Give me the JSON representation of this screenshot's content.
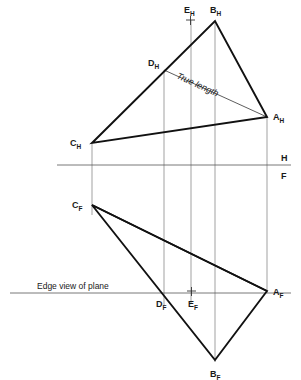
{
  "figure": {
    "width": 301,
    "height": 380,
    "background": "#ffffff",
    "line_color_heavy": "#111111",
    "line_color_light": "#777777",
    "text_color": "#1a1a1a"
  },
  "reference_line": {
    "name": "H-F folding line",
    "upper_label": "H",
    "lower_label": "F",
    "y": 165,
    "x_start": 57,
    "x_end": 291,
    "upper_label_x": 283,
    "upper_label_y": 160,
    "lower_label_x": 283,
    "lower_label_y": 177
  },
  "annotations": {
    "true_length": "True length",
    "edge_view": "Edge view of plane"
  },
  "horizontal_view": {
    "name": "top-view",
    "points": [
      {
        "id": "A_H",
        "letter": "A",
        "sub": "H",
        "x": 267,
        "y": 117,
        "label_x": 273,
        "label_y": 116
      },
      {
        "id": "B_H",
        "letter": "B",
        "sub": "H",
        "x": 215,
        "y": 21,
        "label_x": 212,
        "label_y": 11
      },
      {
        "id": "C_H",
        "letter": "C",
        "sub": "H",
        "x": 92,
        "y": 143,
        "label_x": 72,
        "label_y": 142
      },
      {
        "id": "D_H",
        "letter": "D",
        "sub": "H",
        "x": 164,
        "y": 70,
        "label_x": 150,
        "label_y": 63
      },
      {
        "id": "E_H",
        "letter": "E",
        "sub": "H",
        "x": 190,
        "y": 20,
        "label_x": 186,
        "label_y": 11
      }
    ],
    "triangle": "A_H B_H C_H",
    "true_length_line": "D_H to A_H",
    "cross_marks": [
      "E_H"
    ]
  },
  "frontal_view": {
    "name": "front-view",
    "points": [
      {
        "id": "A_F",
        "letter": "A",
        "sub": "F",
        "x": 267,
        "y": 291,
        "label_x": 273,
        "label_y": 291
      },
      {
        "id": "B_F",
        "letter": "B",
        "sub": "F",
        "x": 215,
        "y": 360,
        "label_x": 211,
        "label_y": 375
      },
      {
        "id": "C_F",
        "letter": "C",
        "sub": "F",
        "x": 92,
        "y": 205,
        "label_x": 74,
        "label_y": 203
      },
      {
        "id": "D_F",
        "letter": "D",
        "sub": "F",
        "x": 164,
        "y": 293,
        "label_x": 157,
        "label_y": 306
      },
      {
        "id": "E_F",
        "letter": "E",
        "sub": "F",
        "x": 191,
        "y": 291,
        "label_x": 190,
        "label_y": 307
      }
    ],
    "triangle": "A_F B_F C_F",
    "edge_view_line": {
      "x_start": 10,
      "x_end": 291,
      "y": 293
    },
    "cross_marks": [
      "E_F"
    ]
  },
  "projectors": {
    "name": "vertical projection lines",
    "lines": [
      {
        "from": "C",
        "x": 92,
        "y_top": 143,
        "y_bottom": 215
      },
      {
        "from": "D",
        "x": 164,
        "y_top": 70,
        "y_bottom": 305
      },
      {
        "from": "E",
        "x": 191,
        "y_top": 20,
        "y_bottom": 303
      },
      {
        "from": "B",
        "x": 215,
        "y_top": 21,
        "y_bottom": 362
      },
      {
        "from": "A",
        "x": 267,
        "y_top": 117,
        "y_bottom": 293
      }
    ]
  }
}
